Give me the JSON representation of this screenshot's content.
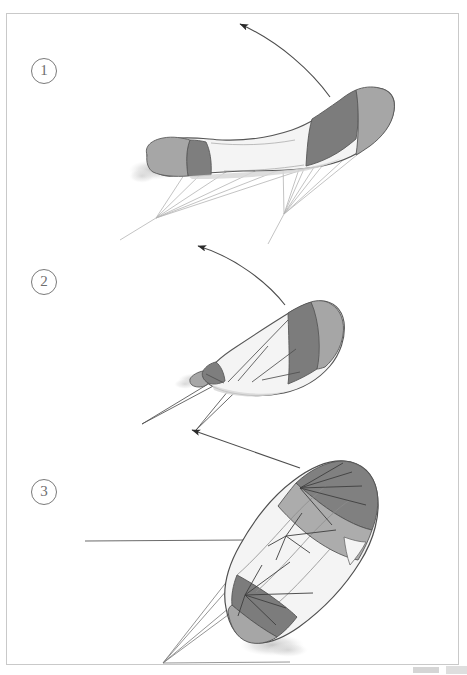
{
  "figure": {
    "background_color": "#ffffff",
    "border_color": "#c9c9c9",
    "page_width": 467,
    "page_height": 675,
    "steps": [
      {
        "number": "①",
        "label": "1",
        "caption": "",
        "marker_x": 31,
        "marker_y": 58
      },
      {
        "number": "②",
        "label": "2",
        "caption": "",
        "marker_x": 31,
        "marker_y": 269
      },
      {
        "number": "③",
        "label": "3",
        "caption": "",
        "marker_x": 31,
        "marker_y": 479
      }
    ],
    "palette": {
      "dark_gray": "#7c7c7c",
      "mid_gray": "#a3a3a3",
      "light_gray": "#d6d6d6",
      "canopy_white": "#f2f2f2",
      "outline": "#4a4a4a",
      "bridle_line": "#b0b0b0",
      "control_line": "#555555",
      "arrow": "#2b2b2b",
      "shadow": "#dcdcdc"
    },
    "arrows": [
      {
        "name": "motion-arrow-1",
        "kind": "curved",
        "direction": "up-left",
        "tip_x": 232,
        "tip_y": 22
      },
      {
        "name": "motion-arrow-2",
        "kind": "curved",
        "direction": "up-left",
        "tip_x": 190,
        "tip_y": 245
      },
      {
        "name": "motion-arrow-3",
        "kind": "straight",
        "direction": "up-left",
        "tip_x": 186,
        "tip_y": 428
      }
    ]
  }
}
